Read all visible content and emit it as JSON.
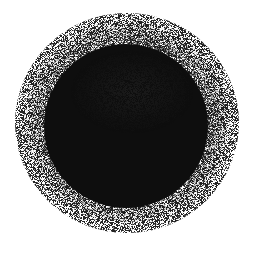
{
  "image": {
    "description": "Spray-paint / airbrush splatter blob",
    "background": "#ffffff",
    "ink": "#111111",
    "center": [
      128,
      122
    ],
    "core_radius": 78,
    "spray_radius": 108
  }
}
